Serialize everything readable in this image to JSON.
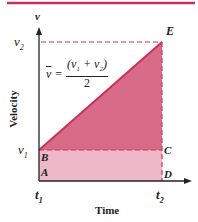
{
  "diagram": {
    "title": "",
    "axes": {
      "y_axis_symbol": "v",
      "y_axis_label": "Velocity",
      "x_axis_label": "Time"
    },
    "tick_labels": {
      "v1": "v",
      "v1_sub": "1",
      "v2": "v",
      "v2_sub": "2",
      "t1": "t",
      "t1_sub": "1",
      "t2": "t",
      "t2_sub": "2"
    },
    "points": {
      "A": "A",
      "B": "B",
      "C": "C",
      "D": "D",
      "E": "E"
    },
    "formula": {
      "lhs": "v",
      "equals": "=",
      "numerator": "(v",
      "num_sub1": "1",
      "num_plus": " + v",
      "num_sub2": "2",
      "num_close": ")",
      "denominator": "2"
    },
    "colors": {
      "accent_line": "#c8325a",
      "triangle_fill": "#d86b88",
      "rectangle_fill": "#efb8c8",
      "axis": "#222222",
      "dashed": "#c8325a"
    }
  }
}
